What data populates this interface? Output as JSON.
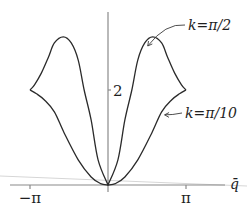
{
  "chart_data": {
    "type": "line",
    "title": "",
    "xlabel": "q̄",
    "ylabel": "",
    "xlim": [
      -3.1416,
      3.1416
    ],
    "ylim": [
      0,
      3.3
    ],
    "x_ticks": [
      {
        "value": -3.1416,
        "label": "−π"
      },
      {
        "value": 3.1416,
        "label": "π"
      }
    ],
    "y_ticks": [
      {
        "value": 2,
        "label": "2"
      }
    ],
    "grid": false,
    "symmetric_about_zero": true,
    "series": [
      {
        "name": "k=π/2",
        "label": "k=π/2",
        "q_half": [
          0,
          0.4,
          0.68,
          0.96,
          1.2,
          1.48,
          1.8,
          2.16,
          2.4,
          2.68,
          2.96,
          3.1416
        ],
        "E_half": [
          0,
          0.53,
          1.37,
          2.0,
          2.63,
          2.99,
          3.12,
          2.99,
          2.69,
          2.36,
          2.11,
          2.0
        ],
        "annotation_point": {
          "q": 1.48,
          "E": 2.99
        }
      },
      {
        "name": "k=π/10",
        "label": "k=π/10",
        "q_half": [
          0,
          0.3,
          0.68,
          1.2,
          1.76,
          2.16,
          2.56,
          2.88,
          3.1416
        ],
        "E_half": [
          0,
          0.03,
          0.17,
          0.53,
          1.09,
          1.54,
          1.79,
          1.92,
          2.0
        ],
        "annotation_point": {
          "q": 2.16,
          "E": 1.54
        }
      }
    ]
  }
}
